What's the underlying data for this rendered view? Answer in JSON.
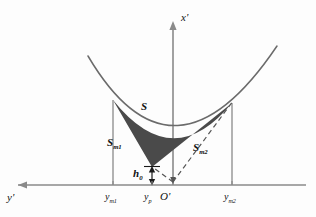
{
  "figure": {
    "type": "geometric-diagram",
    "background_color": "#fdfdfd",
    "axes": {
      "vertical_label": "x'",
      "horizontal_label": "y'",
      "origin_label": "O'",
      "axis_color": "#808080",
      "vertical_axis": {
        "x": 173,
        "y_top": 22,
        "y_bottom": 185
      },
      "horizontal_axis": {
        "y": 185,
        "x_left": 18,
        "x_right": 306
      }
    },
    "curve": {
      "name": "parabola",
      "color": "#666666",
      "vertex": {
        "x": 173,
        "y": 128
      },
      "x_left_end": 88,
      "x_right_end": 277,
      "y_top_left": 56,
      "y_top_right": 46
    },
    "shaded_region": {
      "label": "S",
      "fill_color": "#4a4a4a",
      "vertex_bottom": {
        "x": 152,
        "y": 167
      },
      "left_anchor": {
        "x": 113,
        "y": 100
      },
      "right_anchor": {
        "x": 232,
        "y": 103
      }
    },
    "regions": [
      {
        "name": "total-area",
        "label": "S"
      },
      {
        "name": "left-area",
        "label": "S",
        "subscript": "m1"
      },
      {
        "name": "right-area",
        "label": "S",
        "subscript": "m2"
      }
    ],
    "height_marker": {
      "label": "h",
      "subscript": "0",
      "x": 152,
      "y_top": 167,
      "y_bottom": 185
    },
    "tick_labels": [
      {
        "name": "y-m1",
        "label": "y",
        "subscript": "m1",
        "x": 113
      },
      {
        "name": "y-p",
        "label": "y",
        "subscript": "p",
        "x": 152
      },
      {
        "name": "y-m2",
        "label": "y",
        "subscript": "m2",
        "x": 232
      }
    ],
    "verticals": [
      {
        "name": "left-vertical",
        "x": 113,
        "y_top": 100,
        "y_bottom": 185
      },
      {
        "name": "right-vertical",
        "x": 232,
        "y_top": 103,
        "y_bottom": 185
      }
    ],
    "dashed_lines": [
      {
        "name": "dashed-to-right-anchor",
        "x1": 173,
        "y1": 183,
        "x2": 232,
        "y2": 103
      },
      {
        "name": "dashed-to-bottom-vertex",
        "x1": 173,
        "y1": 183,
        "x2": 152,
        "y2": 167
      }
    ]
  }
}
